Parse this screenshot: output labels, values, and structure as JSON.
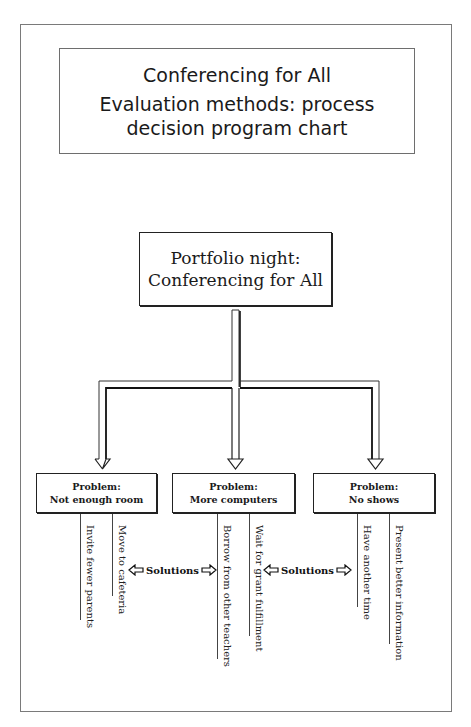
{
  "title_box": {
    "line1": "Conferencing for All",
    "line2": "Evaluation methods: process decision program chart"
  },
  "root": {
    "line1": "Portfolio night:",
    "line2": "Conferencing for All"
  },
  "problems": [
    {
      "label": "Problem:",
      "name": "Not enough room",
      "solutions": [
        "Invite fewer parents",
        "Move to cafeteria"
      ]
    },
    {
      "label": "Problem:",
      "name": "More computers",
      "solutions": [
        "Borrow from other teachers",
        "Wait for grant fulfillment"
      ]
    },
    {
      "label": "Problem:",
      "name": "No shows",
      "solutions": [
        "Have another time",
        "Present better information"
      ]
    }
  ],
  "solutions_labels": [
    "Solutions",
    "Solutions"
  ],
  "icons": {
    "connector": "hollow-down-arrow",
    "solutions_arrows": [
      "hollow-left-arrow",
      "hollow-right-arrow"
    ]
  },
  "colors": {
    "line": "#222222",
    "frame": "#7a7a7a",
    "background": "#ffffff"
  }
}
